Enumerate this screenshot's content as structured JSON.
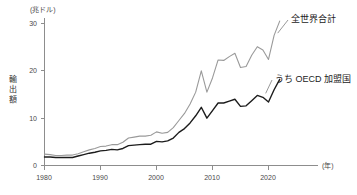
{
  "chart_data": {
    "type": "line",
    "title": "",
    "unit_label": "(兆ドル)",
    "ylabel": "輸出額",
    "xlabel": "(年)",
    "x_tick_labels": [
      "1980",
      "1990",
      "2000",
      "2010",
      "2020"
    ],
    "x_ticks": [
      1980,
      1990,
      2000,
      2010,
      2020
    ],
    "y_tick_labels": [
      "0",
      "10",
      "20",
      "30"
    ],
    "y_ticks": [
      0,
      10,
      20,
      30
    ],
    "xlim": [
      1980,
      2022
    ],
    "ylim": [
      0,
      32
    ],
    "grid": false,
    "legend_position": "inline-right",
    "x": [
      1980,
      1981,
      1982,
      1983,
      1984,
      1985,
      1986,
      1987,
      1988,
      1989,
      1990,
      1991,
      1992,
      1993,
      1994,
      1995,
      1996,
      1997,
      1998,
      1999,
      2000,
      2001,
      2002,
      2003,
      2004,
      2005,
      2006,
      2007,
      2008,
      2009,
      2010,
      2011,
      2012,
      2013,
      2014,
      2015,
      2016,
      2017,
      2018,
      2019,
      2020,
      2021,
      2022
    ],
    "series": [
      {
        "name": "全世界合計",
        "color": "#9a9a9a",
        "values": [
          2.4,
          2.3,
          2.1,
          2.1,
          2.2,
          2.2,
          2.5,
          2.9,
          3.3,
          3.6,
          4.0,
          4.1,
          4.4,
          4.4,
          4.9,
          5.8,
          6.0,
          6.2,
          6.2,
          6.4,
          7.1,
          6.8,
          7.0,
          8.0,
          9.5,
          11.0,
          13.0,
          15.5,
          20.0,
          15.5,
          18.5,
          22.3,
          22.2,
          23.0,
          23.7,
          20.7,
          20.9,
          23.3,
          25.1,
          24.4,
          22.4,
          27.5,
          30.5
        ]
      },
      {
        "name": "うち OECD 加盟国",
        "color": "#1c1c1c",
        "values": [
          1.8,
          1.8,
          1.7,
          1.7,
          1.7,
          1.7,
          2.0,
          2.3,
          2.6,
          2.8,
          3.1,
          3.2,
          3.4,
          3.3,
          3.6,
          4.2,
          4.3,
          4.4,
          4.5,
          4.5,
          5.1,
          5.0,
          5.2,
          5.8,
          7.0,
          7.8,
          9.0,
          10.5,
          12.3,
          10.0,
          11.6,
          13.2,
          13.2,
          13.6,
          14.0,
          12.5,
          12.6,
          13.7,
          14.8,
          14.4,
          13.4,
          16.0,
          18.2
        ]
      }
    ],
    "annotations": [
      {
        "text": "全世界合計",
        "target_year": 2022,
        "target_value": 30.5
      },
      {
        "text": "うち OECD 加盟国",
        "target_year": 2022,
        "target_value": 18.2
      }
    ]
  }
}
